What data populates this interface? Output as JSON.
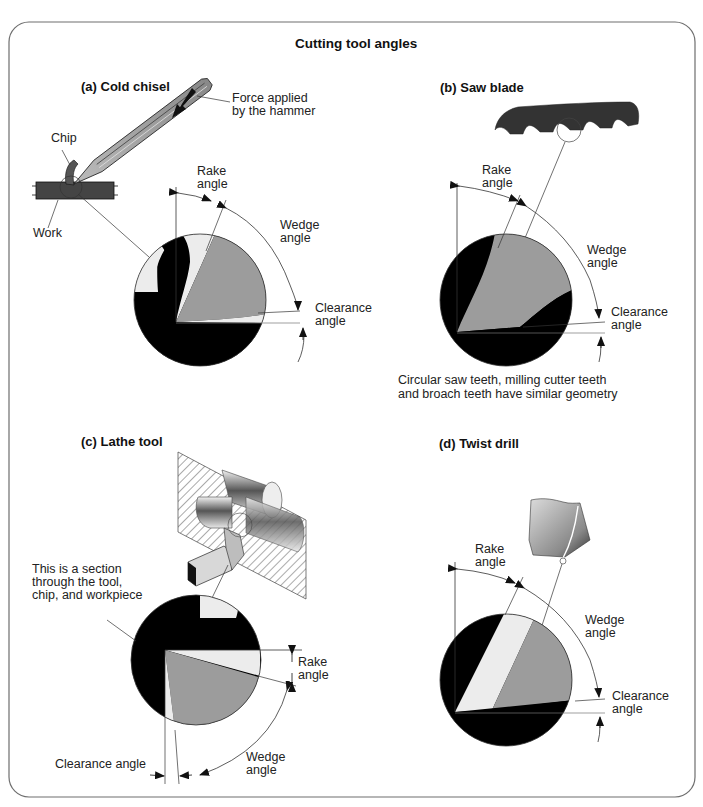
{
  "title": "Cutting tool angles",
  "colors": {
    "frame": "#6e6e6e",
    "tool_gray": "#9c9c9c",
    "chip_light": "#ececec",
    "work_black": "#000000",
    "line": "#333333"
  },
  "panels": {
    "a": {
      "heading": "(a) Cold chisel",
      "labels": {
        "force_line1": "Force applied",
        "force_line2": "by the hammer",
        "chip": "Chip",
        "work": "Work",
        "rake_line1": "Rake",
        "rake_line2": "angle",
        "wedge_line1": "Wedge",
        "wedge_line2": "angle",
        "clearance_line1": "Clearance",
        "clearance_line2": "angle"
      }
    },
    "b": {
      "heading": "(b) Saw blade",
      "labels": {
        "rake_line1": "Rake",
        "rake_line2": "angle",
        "wedge_line1": "Wedge",
        "wedge_line2": "angle",
        "clearance_line1": "Clearance",
        "clearance_line2": "angle"
      },
      "note_line1": "Circular saw teeth, milling cutter teeth",
      "note_line2": "and broach teeth have similar geometry"
    },
    "c": {
      "heading": "(c) Lathe tool",
      "labels": {
        "section_line1": "This is a section",
        "section_line2": "through the tool,",
        "section_line3": "chip, and workpiece",
        "rake_line1": "Rake",
        "rake_line2": "angle",
        "wedge_line1": "Wedge",
        "wedge_line2": "angle",
        "clearance": "Clearance angle"
      }
    },
    "d": {
      "heading": "(d) Twist drill",
      "labels": {
        "rake_line1": "Rake",
        "rake_line2": "angle",
        "wedge_line1": "Wedge",
        "wedge_line2": "angle",
        "clearance_line1": "Clearance",
        "clearance_line2": "angle"
      }
    }
  }
}
